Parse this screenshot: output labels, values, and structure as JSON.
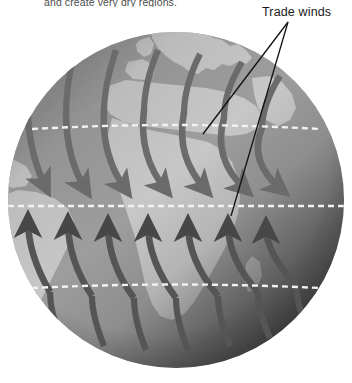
{
  "figure": {
    "type": "diagram",
    "caption_top": "and create very dry regions.",
    "callouts": [
      {
        "id": "trade-winds",
        "label": "Trade winds",
        "label_x": 262,
        "label_y": 5,
        "leader_origin": {
          "x": 288,
          "y": 22
        },
        "leader_targets": [
          {
            "x": 203,
            "y": 134
          },
          {
            "x": 231,
            "y": 216
          }
        ]
      }
    ],
    "globe": {
      "center_x": 176,
      "center_y": 200,
      "radius": 168,
      "ocean_light": "#a8a8a8",
      "ocean_dark": "#2e2e2e",
      "land_light": "#c9c9c9",
      "land_dark": "#3e3e3e",
      "arrow_color": "#6e6e6e",
      "arrow_color_dark": "#4a4a4a",
      "latitude_line_color": "#ffffff",
      "latitude_line_style": "dashed"
    },
    "latitude_lines": [
      {
        "name": "upper-mid-latitude",
        "y": 29
      },
      {
        "name": "tropic-of-cancer",
        "y": 129
      },
      {
        "name": "equator",
        "y": 206
      },
      {
        "name": "tropic-of-capricorn",
        "y": 288
      },
      {
        "name": "lower-mid-latitude",
        "y": 375
      }
    ],
    "wind_bands": [
      {
        "name": "northeast-trades",
        "description": "Curved arrows sweeping from upper right toward lower left, converging on the equator",
        "arrow_count": 7,
        "direction": "northeast-to-southwest"
      },
      {
        "name": "southeast-trades",
        "description": "Curved arrows sweeping from lower right toward upper left, converging on the equator",
        "arrow_count": 7,
        "direction": "southeast-to-northwest"
      }
    ],
    "landmasses": [
      "Europe",
      "Mediterranean Sea",
      "North Africa",
      "Sub-Saharan Africa",
      "South America",
      "Arabian Peninsula"
    ],
    "background_color": "#ffffff"
  }
}
